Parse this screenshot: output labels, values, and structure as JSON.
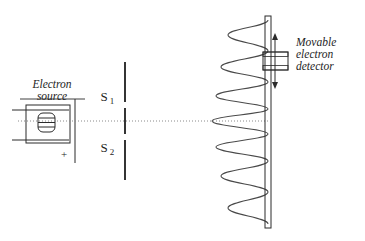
{
  "figure": {
    "background_color": "#ffffff",
    "ink_color": "#2b2b2b",
    "axis_color": "#8a8a8a",
    "width": 365,
    "height": 241
  },
  "source": {
    "label_line1": "Electron",
    "label_line2": "source",
    "polarity_label": "+",
    "filament_name": "electron-gun-filament"
  },
  "slits": {
    "upper_label": "S",
    "upper_subscript": "1",
    "lower_label": "S",
    "lower_subscript": "2",
    "barrier_name": "double-slit-barrier"
  },
  "detector": {
    "label_line1": "Movable",
    "label_line2": "electron",
    "label_line3": "detector",
    "motion": "vertical",
    "arrow_name": "movable-detector-arrow"
  },
  "screen": {
    "name": "detection-screen"
  },
  "chart_data": {
    "type": "line",
    "xlabel": "Intensity",
    "ylabel": "Position on screen",
    "orientation": "horizontal-intensity-vs-vertical-position",
    "axis_baseline_x": 268,
    "center_y": 121,
    "peaks": [
      {
        "order": -3,
        "y": 35,
        "tip_x": 228,
        "relative_intensity": 0.4
      },
      {
        "order": -2,
        "y": 67,
        "tip_x": 221,
        "relative_intensity": 0.53
      },
      {
        "order": -1,
        "y": 96,
        "tip_x": 216,
        "relative_intensity": 0.65
      },
      {
        "order": 0,
        "y": 121,
        "tip_x": 212,
        "relative_intensity": 1.0
      },
      {
        "order": 1,
        "y": 147,
        "tip_x": 216,
        "relative_intensity": 0.65
      },
      {
        "order": 2,
        "y": 176,
        "tip_x": 221,
        "relative_intensity": 0.53
      },
      {
        "order": 3,
        "y": 208,
        "tip_x": 228,
        "relative_intensity": 0.4
      }
    ],
    "minima_y": [
      20,
      51,
      82,
      109,
      134,
      161,
      192,
      224
    ],
    "grid": false,
    "legend": false
  }
}
